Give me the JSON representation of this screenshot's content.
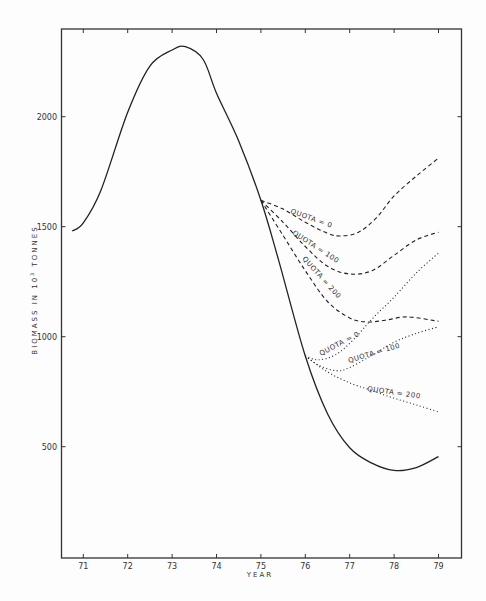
{
  "chart_data": {
    "type": "line",
    "title": "",
    "xlabel": "YEAR",
    "ylabel": "BIOMASS IN 10³ TONNES",
    "xlim": [
      70.5,
      79.5
    ],
    "ylim": [
      0,
      2450
    ],
    "x_ticks": [
      71,
      72,
      73,
      74,
      75,
      76,
      77,
      78,
      79
    ],
    "y_ticks": [
      500,
      1000,
      1500,
      2000
    ],
    "grid": false,
    "legend": "none (inline curve labels)",
    "series": [
      {
        "name": "Historical / no management",
        "style": "solid",
        "x": [
          70.75,
          71,
          71.4,
          72,
          72.5,
          73,
          73.3,
          73.7,
          74,
          74.5,
          75,
          75.4,
          76,
          76.5,
          77,
          77.5,
          78,
          78.5,
          79
        ],
        "y": [
          1480,
          1517,
          1667,
          2020,
          2230,
          2303,
          2318,
          2260,
          2107,
          1890,
          1620,
          1347,
          912,
          650,
          495,
          425,
          392,
          405,
          455
        ]
      },
      {
        "name": "QUOTA = 0 (dashed, from 75)",
        "style": "dashed",
        "x": [
          75,
          75.5,
          76,
          76.5,
          76.8,
          77.2,
          77.6,
          78,
          78.5,
          79
        ],
        "y": [
          1620,
          1580,
          1520,
          1470,
          1458,
          1475,
          1540,
          1640,
          1730,
          1812
        ]
      },
      {
        "name": "QUOTA = 100 (dashed, from 75)",
        "style": "dashed",
        "x": [
          75,
          75.5,
          76,
          76.5,
          77,
          77.5,
          78,
          78.5,
          79
        ],
        "y": [
          1620,
          1520,
          1410,
          1320,
          1285,
          1300,
          1370,
          1440,
          1475
        ]
      },
      {
        "name": "QUOTA = 200 (dashed, from 75)",
        "style": "dashed",
        "x": [
          75,
          75.5,
          76,
          76.5,
          77,
          77.4,
          77.8,
          78.3,
          79
        ],
        "y": [
          1620,
          1460,
          1300,
          1160,
          1085,
          1067,
          1075,
          1090,
          1070
        ]
      },
      {
        "name": "QUOTA = 0 (dotted, from 76)",
        "style": "dotted",
        "x": [
          76,
          76.3,
          76.7,
          77.1,
          77.5,
          78,
          78.5,
          79
        ],
        "y": [
          912,
          895,
          920,
          990,
          1080,
          1180,
          1290,
          1380
        ]
      },
      {
        "name": "QUOTA = 100 (dotted, from 76)",
        "style": "dotted",
        "x": [
          76,
          76.3,
          76.7,
          77,
          77.5,
          78,
          78.5,
          79
        ],
        "y": [
          912,
          870,
          845,
          860,
          915,
          975,
          1015,
          1045
        ]
      },
      {
        "name": "QUOTA = 200 (dotted, from 76)",
        "style": "dotted",
        "x": [
          76,
          76.5,
          77,
          77.5,
          78,
          78.5,
          79
        ],
        "y": [
          912,
          840,
          790,
          755,
          720,
          690,
          658
        ]
      }
    ],
    "annotations": [
      {
        "text": "QUOTA = 0",
        "near_series": "QUOTA = 0 (dashed, from 75)"
      },
      {
        "text": "QUOTA = 100",
        "near_series": "QUOTA = 100 (dashed, from 75)"
      },
      {
        "text": "QUOTA = 200",
        "near_series": "QUOTA = 200 (dashed, from 75)"
      },
      {
        "text": "QUOTA = 0",
        "near_series": "QUOTA = 0 (dotted, from 76)"
      },
      {
        "text": "QUOTA = 100",
        "near_series": "QUOTA = 100 (dotted, from 76)"
      },
      {
        "text": "QUOTA = 200",
        "near_series": "QUOTA = 200 (dotted, from 76)"
      }
    ]
  },
  "labels": {
    "xlabel": "YEAR",
    "ylabel_main": "BIOMASS IN 10",
    "ylabel_sup": "3",
    "ylabel_tail": " TONNES",
    "quota_0": "QUOTA = 0",
    "quota_100": "QUOTA = 100",
    "quota_200": "QUOTA = 200"
  }
}
